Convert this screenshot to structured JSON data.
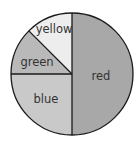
{
  "chart_data": {
    "type": "pie",
    "title": "",
    "categories": [
      "red",
      "blue",
      "green",
      "yellow"
    ],
    "values": [
      50,
      25,
      12.5,
      12.5
    ],
    "unit": "percent",
    "start_angle_deg": 90,
    "direction": "clockwise",
    "legend": "none (labels inside slices)",
    "slices": [
      {
        "label": "red",
        "value": 50,
        "color": "#a8a8a8"
      },
      {
        "label": "blue",
        "value": 25,
        "color": "#c9c9c9"
      },
      {
        "label": "green",
        "value": 12.5,
        "color": "#b9b9b9"
      },
      {
        "label": "yellow",
        "value": 12.5,
        "color": "#ededed"
      }
    ]
  },
  "labels": {
    "red": "red",
    "blue": "blue",
    "green": "green",
    "yellow": "yellow"
  }
}
